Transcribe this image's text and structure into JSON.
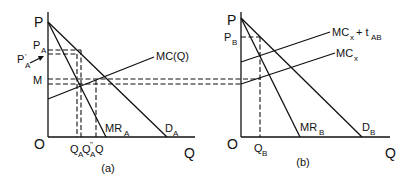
{
  "panel_a": {
    "caption": "(a)",
    "y_axis_label": "P",
    "x_axis_label": "Q",
    "origin_label": "O",
    "price_labels": {
      "pa": {
        "main": "P",
        "sub": "A"
      },
      "pa_prime": {
        "main": "P",
        "sup": "'",
        "sub": "A"
      },
      "m": "M"
    },
    "curve_labels": {
      "mc": "MC(Q)",
      "mr": {
        "main": "MR",
        "sub": "A"
      },
      "d": {
        "main": "D",
        "sub": "A"
      }
    },
    "quantity_labels": {
      "qa": {
        "main": "Q",
        "sub": "A"
      },
      "qa_dprime": {
        "main": "Q",
        "sup": "\"",
        "sub": "A"
      },
      "q": "Q"
    }
  },
  "panel_b": {
    "caption": "(b)",
    "y_axis_label": "P",
    "x_axis_label": "Q",
    "origin_label": "O",
    "price_labels": {
      "pb": {
        "main": "P",
        "sub": "B"
      }
    },
    "curve_labels": {
      "mc_tax": {
        "main": "MC",
        "sub": "x",
        "plus": "+ t",
        "sub2": "AB"
      },
      "mc": {
        "main": "MC",
        "sub": "x"
      },
      "mr": {
        "main": "MR",
        "sub": "B"
      },
      "d": {
        "main": "D",
        "sub": "B"
      }
    },
    "quantity_labels": {
      "qb": {
        "main": "Q",
        "sub": "B"
      }
    }
  }
}
